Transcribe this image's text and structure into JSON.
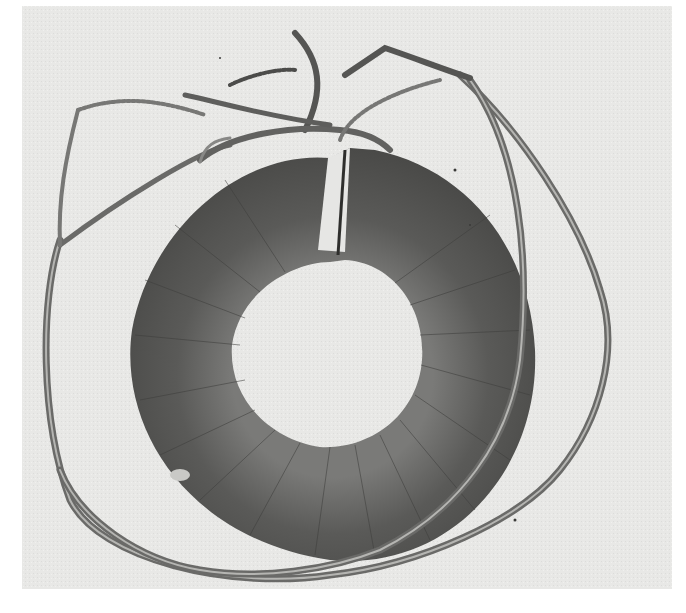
{
  "image": {
    "subject": "Toroidal coil with wound insulated wire and lead wires",
    "style": "grayscale photograph",
    "colors": {
      "background": "#e9e9e7",
      "border": "#ffffff",
      "coil_dark": "#4c4c4a",
      "coil_mid": "#666664",
      "coil_light": "#8a8a88",
      "wire": "#6a6a68",
      "wire_highlight": "#b5b5b2",
      "hole": "#ededeb"
    }
  }
}
